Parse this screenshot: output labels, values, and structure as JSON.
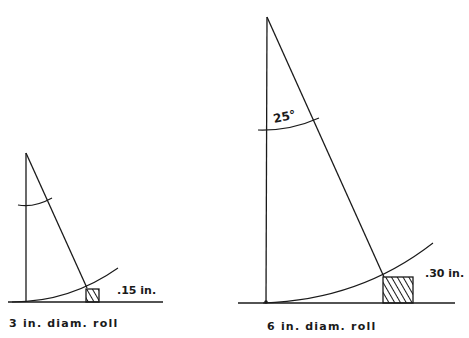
{
  "diagrams": [
    {
      "id": "small",
      "caption": "3 in. diam. roll",
      "dimension_label": ".15 in."
    },
    {
      "id": "large",
      "caption": "6 in. diam. roll",
      "dimension_label": ".30 in.",
      "angle_label": "25°"
    }
  ],
  "colors": {
    "line": "#1a1a1a",
    "background": "#ffffff"
  }
}
